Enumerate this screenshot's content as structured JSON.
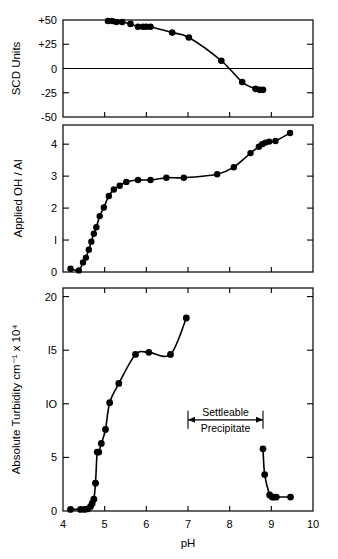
{
  "figure": {
    "xlabel": "pH",
    "x_ticks": [
      "4",
      "5",
      "6",
      "7",
      "8",
      "9",
      "10"
    ],
    "xlim": [
      4,
      10
    ]
  },
  "chart_data": [
    {
      "type": "scatter",
      "panel": "top",
      "title": "",
      "xlabel": "pH",
      "ylabel": "SCD  Units",
      "xlim": [
        4,
        10
      ],
      "ylim": [
        -50,
        50
      ],
      "x_ticks": [
        4,
        5,
        6,
        7,
        8,
        9,
        10
      ],
      "y_ticks": [
        -50,
        -25,
        0,
        25,
        50
      ],
      "y_tick_labels": [
        "-50",
        "-25",
        "0",
        "+25",
        "+50"
      ],
      "grid": false,
      "zero_line": true,
      "legend": "none",
      "x": [
        5.08,
        5.18,
        5.28,
        5.42,
        5.62,
        5.8,
        5.92,
        6.0,
        6.1,
        6.62,
        7.02,
        7.8,
        8.3,
        8.62,
        8.72,
        8.8
      ],
      "y": [
        49,
        49,
        48,
        48,
        46,
        43,
        43,
        43,
        43,
        37,
        32,
        8,
        -14,
        -21,
        -22,
        -22
      ]
    },
    {
      "type": "scatter",
      "panel": "middle",
      "title": "",
      "xlabel": "pH",
      "ylabel": "Applied  OH / Al",
      "xlim": [
        4,
        10
      ],
      "ylim": [
        0,
        4.6
      ],
      "x_ticks": [
        4,
        5,
        6,
        7,
        8,
        9,
        10
      ],
      "y_ticks": [
        0,
        1,
        2,
        3,
        4
      ],
      "y_tick_labels": [
        "0",
        "I",
        "2",
        "3",
        "4"
      ],
      "grid": false,
      "legend": "none",
      "x": [
        4.18,
        4.38,
        4.48,
        4.55,
        4.62,
        4.68,
        4.74,
        4.8,
        4.88,
        4.98,
        5.1,
        5.22,
        5.36,
        5.52,
        5.8,
        6.1,
        6.48,
        6.9,
        7.7,
        8.1,
        8.5,
        8.7,
        8.78,
        8.86,
        8.95,
        9.1,
        9.45
      ],
      "y": [
        0.1,
        0.05,
        0.3,
        0.45,
        0.7,
        0.95,
        1.2,
        1.4,
        1.75,
        2.02,
        2.38,
        2.58,
        2.7,
        2.82,
        2.88,
        2.88,
        2.95,
        2.95,
        3.06,
        3.28,
        3.72,
        3.92,
        4.0,
        4.05,
        4.08,
        4.1,
        4.35
      ]
    },
    {
      "type": "scatter",
      "panel": "bottom",
      "title": "",
      "xlabel": "pH",
      "ylabel": "Absolute  Turbidity  cm⁻¹ x 10⁴",
      "xlim": [
        4,
        10
      ],
      "ylim": [
        0,
        20.8
      ],
      "x_ticks": [
        4,
        5,
        6,
        7,
        8,
        9,
        10
      ],
      "y_ticks": [
        0,
        5,
        10,
        15,
        20
      ],
      "y_tick_labels": [
        "0",
        "5",
        "IO",
        "I5",
        "20"
      ],
      "grid": false,
      "legend": "none",
      "series": [
        {
          "name": "dispersed",
          "x": [
            4.18,
            4.42,
            4.52,
            4.6,
            4.66,
            4.7,
            4.74,
            4.78,
            4.82,
            4.86,
            4.92,
            5.02,
            5.12,
            5.34,
            5.74,
            6.06,
            6.58,
            6.96
          ],
          "y": [
            0.15,
            0.15,
            0.15,
            0.2,
            0.4,
            0.7,
            1.1,
            2.6,
            5.5,
            5.5,
            6.3,
            7.6,
            10.1,
            11.9,
            14.6,
            14.8,
            14.6,
            18.0
          ]
        },
        {
          "name": "settleable-precipitate",
          "x": [
            8.8,
            8.84,
            8.96,
            9.02,
            9.06,
            9.12,
            9.46
          ],
          "y": [
            5.8,
            3.4,
            1.5,
            1.3,
            1.3,
            1.3,
            1.3
          ]
        }
      ],
      "annotation": {
        "label_top": "Settleable",
        "label_bottom": "Precipitate",
        "x_start": 7.0,
        "x_end": 8.8,
        "y": 8.5
      }
    }
  ]
}
